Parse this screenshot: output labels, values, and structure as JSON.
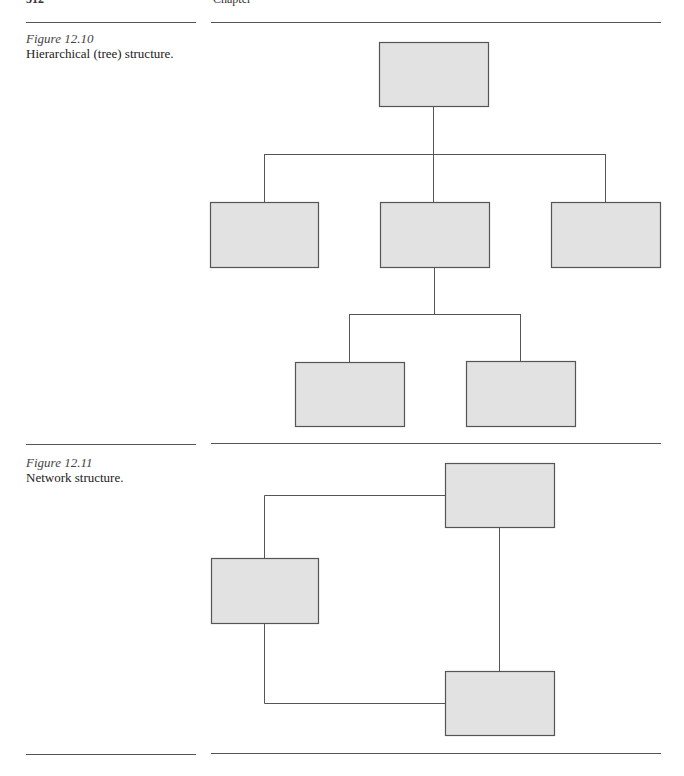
{
  "page_header": {
    "page_number": "312",
    "running_title": "Chapter"
  },
  "figures": [
    {
      "number": "Figure 12.10",
      "caption": "Hierarchical (tree) structure.",
      "type": "tree",
      "nodes": [
        {
          "id": "root",
          "x": 379,
          "y": 42,
          "w": 109,
          "h": 64
        },
        {
          "id": "a",
          "x": 210,
          "y": 202,
          "w": 108,
          "h": 65
        },
        {
          "id": "b",
          "x": 380,
          "y": 202,
          "w": 109,
          "h": 65
        },
        {
          "id": "c",
          "x": 551,
          "y": 202,
          "w": 109,
          "h": 65
        },
        {
          "id": "b1",
          "x": 295,
          "y": 362,
          "w": 109,
          "h": 64
        },
        {
          "id": "b2",
          "x": 466,
          "y": 361,
          "w": 109,
          "h": 65
        }
      ]
    },
    {
      "number": "Figure 12.11",
      "caption": "Network structure.",
      "type": "network",
      "nodes": [
        {
          "id": "n1",
          "x": 445,
          "y": 463,
          "w": 109,
          "h": 64
        },
        {
          "id": "n2",
          "x": 211,
          "y": 558,
          "w": 107,
          "h": 65
        },
        {
          "id": "n3",
          "x": 445,
          "y": 671,
          "w": 109,
          "h": 64
        }
      ]
    }
  ],
  "colors": {
    "box_fill": "#e2e2e2",
    "box_stroke": "#555555",
    "line": "#555555"
  }
}
